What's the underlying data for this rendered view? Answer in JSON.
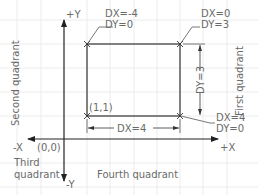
{
  "axes": {
    "pos_y": "+Y",
    "neg_y": "-Y",
    "pos_x": "+X",
    "neg_x": "-X",
    "origin": "(0,0)"
  },
  "quadrants": {
    "first": "First quadrant",
    "second": "Second quadrant",
    "third_line1": "Third",
    "third_line2": "quadrant",
    "fourth": "Fourth quadrant"
  },
  "rectangle": {
    "start_point": "(1,1)",
    "corners": [
      {
        "id": "top-left",
        "dx": "DX=-4",
        "dy": "DY=0"
      },
      {
        "id": "top-right",
        "dx": "DX=0",
        "dy": "DY=3"
      },
      {
        "id": "bottom-right",
        "dx": "DX=4",
        "dy": "DY=0"
      }
    ]
  },
  "dimensions": {
    "width": "DX=4",
    "height": "DY=3"
  },
  "colors": {
    "line": "#333333",
    "text": "#6a6a6a",
    "grid": "#ececec"
  }
}
